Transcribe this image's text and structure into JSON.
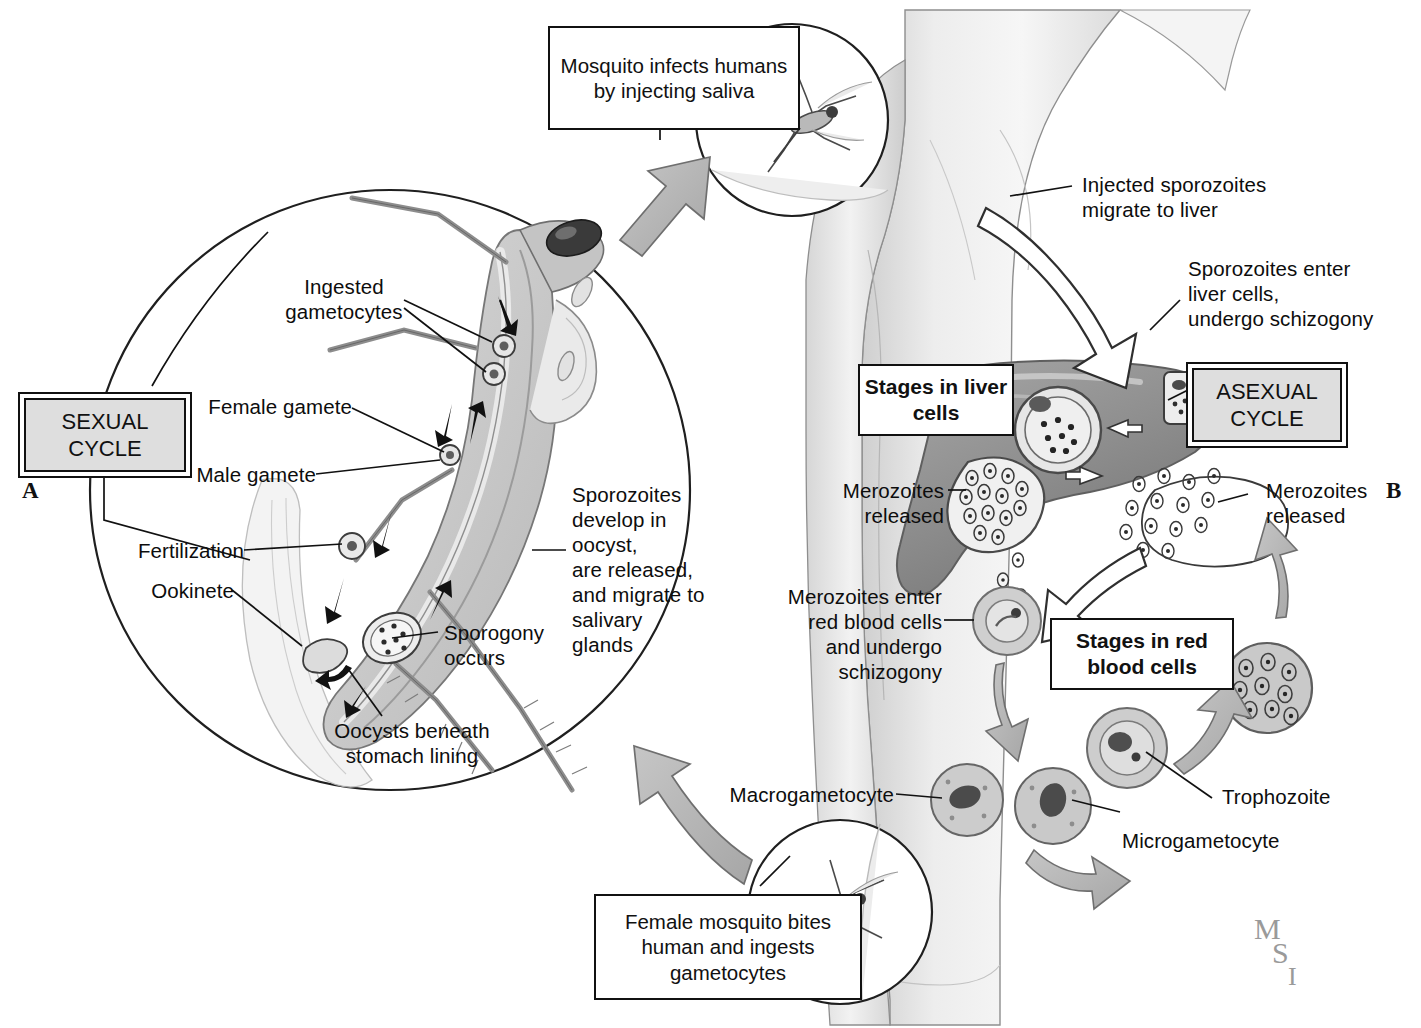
{
  "figure": {
    "panel_a_id": "A",
    "panel_b_id": "B",
    "artist_signature": {
      "l1": "M",
      "l2": "S",
      "l3": "I"
    }
  },
  "cycle_badges": {
    "sexual": "SEXUAL\nCYCLE",
    "asexual": "ASEXUAL\nCYCLE"
  },
  "callout_boxes": {
    "mosquito_infects": "Mosquito infects\nhumans by injecting\nsaliva",
    "female_bites": "Female mosquito\nbites human and\ningests gametocytes"
  },
  "stage_boxes": {
    "liver": "Stages in\nliver cells",
    "rbc": "Stages in\nred blood cells"
  },
  "mosquito_labels": {
    "ingested_gametocytes": "Ingested\ngametocytes",
    "female_gamete": "Female gamete",
    "male_gamete": "Male gamete",
    "fertilization": "Fertilization",
    "ookinete": "Ookinete",
    "sporogony": "Sporogony\noccurs",
    "oocysts": "Oocysts beneath\nstomach lining",
    "sporozoites_develop": "Sporozoites\ndevelop in oocyst,\nare released,\nand migrate to\nsalivary\nglands"
  },
  "human_labels": {
    "injected_sporozoites": "Injected sporozoites\nmigrate to liver",
    "sporozoites_enter_liver": "Sporozoites enter\nliver cells,\nundergo schizogony",
    "merozoites_released_liver": "Merozoites\nreleased",
    "merozoites_released_rbc": "Merozoites\nreleased",
    "merozoites_enter_rbc": "Merozoites enter\nred blood cells\nand undergo\nschizogony",
    "macrogametocyte": "Macrogametocyte",
    "microgametocyte": "Microgametocyte",
    "trophozoite": "Trophozoite"
  },
  "colors": {
    "ink": "#111111",
    "badge_fill": "#dedede",
    "skin_light": "#efefef",
    "skin_mid": "#dcdcdc",
    "skin_shade": "#c8c8c8",
    "liver": "#9a9a9a",
    "liver_dark": "#7d7d7d",
    "arrow_gray": "#b4b4b4",
    "cell_fill": "#d0d0d0",
    "mosquito_body": "#cfcfcf"
  }
}
